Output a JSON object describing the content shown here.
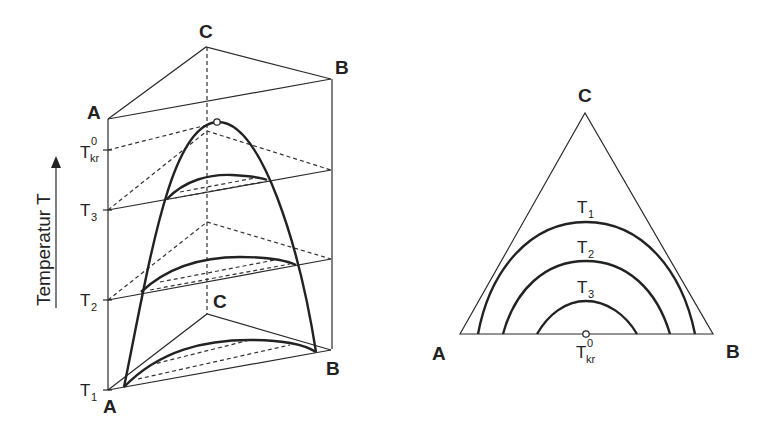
{
  "figure": {
    "left_diagram": {
      "type": "3D prism phase diagram",
      "top_vertices": {
        "A": "A",
        "B": "B",
        "C": "C"
      },
      "bottom_vertices": {
        "A": "A",
        "B": "B",
        "C": "C"
      },
      "axis_label": "Temperatur T",
      "levels": [
        {
          "name": "T",
          "sub": "kr",
          "sup": "0"
        },
        {
          "name": "T",
          "sub": "3",
          "sup": ""
        },
        {
          "name": "T",
          "sub": "2",
          "sup": ""
        },
        {
          "name": "T",
          "sub": "1",
          "sup": ""
        }
      ]
    },
    "right_diagram": {
      "type": "ternary triangle isotherms",
      "vertices": {
        "A": "A",
        "B": "B",
        "C": "C"
      },
      "curves": [
        {
          "name": "T",
          "sub": "1"
        },
        {
          "name": "T",
          "sub": "2"
        },
        {
          "name": "T",
          "sub": "3"
        }
      ],
      "critical_point": {
        "name": "T",
        "sub": "kr",
        "sup": "0"
      }
    }
  }
}
